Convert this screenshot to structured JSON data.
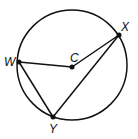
{
  "diagram": {
    "type": "circle-geometry",
    "circle": {
      "center_label": "C",
      "cx": 72,
      "cy": 65,
      "r": 55
    },
    "points": [
      {
        "label": "W",
        "x": 19,
        "y": 62,
        "lx": 4,
        "ly": 66
      },
      {
        "label": "X",
        "x": 119,
        "y": 35,
        "lx": 121,
        "ly": 31
      },
      {
        "label": "Y",
        "x": 53,
        "y": 117,
        "lx": 49,
        "ly": 133
      },
      {
        "label": "C",
        "x": 72,
        "y": 67,
        "lx": 70,
        "ly": 62
      }
    ],
    "segments": [
      [
        "W",
        "C"
      ],
      [
        "C",
        "X"
      ],
      [
        "W",
        "Y"
      ],
      [
        "Y",
        "X"
      ]
    ],
    "colors": {
      "stroke": "#111111",
      "background": "#ffffff"
    }
  }
}
